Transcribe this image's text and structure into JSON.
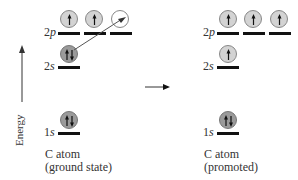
{
  "axis": {
    "label": "Energy",
    "direction": "up"
  },
  "colors": {
    "full_orbital": "#9a9a9a",
    "half_orbital": "#d3d3d3",
    "empty_orbital": "#ffffff",
    "level_line": "#111111",
    "arrow": "#555555"
  },
  "panels": [
    {
      "id": "ground",
      "caption_line1": "C atom",
      "caption_line2": "(ground state)",
      "levels": [
        {
          "label_num": "2",
          "label_sub": "p",
          "orbitals": [
            "up",
            "up",
            "empty"
          ]
        },
        {
          "label_num": "2",
          "label_sub": "s",
          "orbitals": [
            "pair"
          ]
        },
        {
          "label_num": "1",
          "label_sub": "s",
          "orbitals": [
            "pair"
          ]
        }
      ],
      "promotion_arrow": "2s electron promoted to empty 2p orbital"
    },
    {
      "id": "promoted",
      "caption_line1": "C atom",
      "caption_line2": "(promoted)",
      "levels": [
        {
          "label_num": "2",
          "label_sub": "p",
          "orbitals": [
            "up",
            "up",
            "up"
          ]
        },
        {
          "label_num": "2",
          "label_sub": "s",
          "orbitals": [
            "up"
          ]
        },
        {
          "label_num": "1",
          "label_sub": "s",
          "orbitals": [
            "pair"
          ]
        }
      ]
    }
  ],
  "transition_arrow": "ground state to promoted"
}
